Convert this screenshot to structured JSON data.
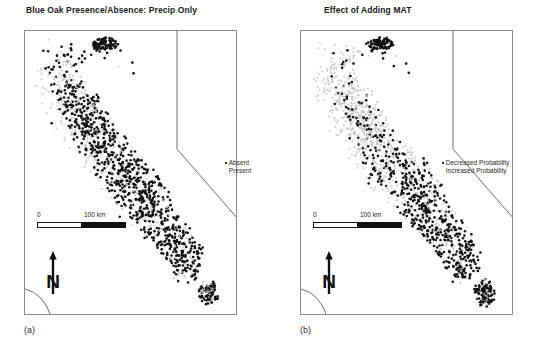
{
  "figure": {
    "width": 551,
    "height": 349,
    "background": "#ffffff"
  },
  "panels": [
    {
      "key": "a",
      "label": "(a)",
      "title": "Blue Oak Presence/Absence: Precip Only",
      "legend": {
        "items": [
          {
            "marker": "dot",
            "label": "Absent",
            "color": "#c9c9c9"
          },
          {
            "marker": "none",
            "label": "Present",
            "color": "#111111"
          }
        ]
      },
      "scalebar": {
        "start": "0",
        "end": "100 km"
      },
      "north_arrow": {
        "label": "N"
      }
    },
    {
      "key": "b",
      "label": "(b)",
      "title": "Effect of Adding MAT",
      "legend": {
        "items": [
          {
            "marker": "dot",
            "label": "Decreased Probability",
            "color": "#c9c9c9"
          },
          {
            "marker": "none",
            "label": "Increased Probability",
            "color": "#111111"
          }
        ]
      },
      "scalebar": {
        "start": "0",
        "end": "100 km"
      },
      "north_arrow": {
        "label": "N"
      }
    }
  ],
  "chart_data": {
    "type": "scatter",
    "subtitle": "Two map panels comparing a precipitation-only model with the effect of adding mean annual temperature (MAT)",
    "xlabel": "",
    "ylabel": "",
    "grid": false,
    "legend_position": "right-outside",
    "projection_note": "California state outline, scale bar 0-100 km, north arrow",
    "panels": [
      {
        "name": "(a) Blue Oak Presence/Absence: Precip Only",
        "series": [
          {
            "name": "Absent",
            "color": "#c9c9c9",
            "marker": "dot",
            "n_points": 640,
            "description": "Light grey points concentrated along the western Coast Ranges and Central Valley margins"
          },
          {
            "name": "Present",
            "color": "#111111",
            "marker": "dot",
            "n_points": 900,
            "description": "Dark points forming a dense band through the Sierra Nevada foothills and southern Coast Ranges"
          }
        ]
      },
      {
        "name": "(b) Effect of Adding MAT",
        "series": [
          {
            "name": "Decreased Probability",
            "color": "#c9c9c9",
            "marker": "dot",
            "n_points": 760,
            "description": "Light grey points dominating the northern half of the distribution"
          },
          {
            "name": "Increased Probability",
            "color": "#111111",
            "marker": "dot",
            "n_points": 700,
            "description": "Dark points concentrated in the southern Sierra foothills and southern Coast Ranges"
          }
        ]
      }
    ]
  }
}
